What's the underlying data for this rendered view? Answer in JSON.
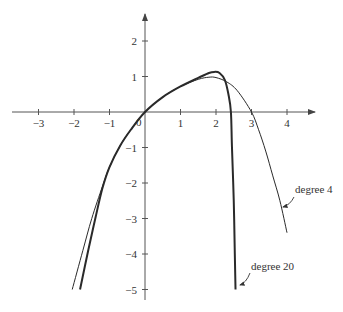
{
  "chart_data": {
    "type": "line",
    "title": "",
    "xlabel": "",
    "ylabel": "",
    "xlim": [
      -3.8,
      4.8
    ],
    "ylim": [
      -5.3,
      2.7
    ],
    "grid": false,
    "legend": "none (inline annotations)",
    "x_ticks": [
      -3,
      -2,
      -1,
      0,
      1,
      2,
      3,
      4
    ],
    "x_tick_labels": [
      "−3",
      "−2",
      "−1",
      "0",
      "1",
      "2",
      "3",
      "4"
    ],
    "y_ticks": [
      2,
      1,
      -1,
      -2,
      -3,
      -4,
      -5
    ],
    "y_tick_labels": [
      "2",
      "1",
      "−1",
      "−2",
      "−3",
      "−4",
      "−5"
    ],
    "series": [
      {
        "name": "degree 4",
        "stroke_width": 1,
        "points": [
          [
            -2.05,
            -5.0
          ],
          [
            -1.75,
            -3.9
          ],
          [
            -1.5,
            -3.0
          ],
          [
            -1.2,
            -2.1
          ],
          [
            -1.0,
            -1.55
          ],
          [
            -0.7,
            -0.95
          ],
          [
            -0.4,
            -0.5
          ],
          [
            0,
            0
          ],
          [
            0.5,
            0.42
          ],
          [
            1.0,
            0.72
          ],
          [
            1.5,
            0.92
          ],
          [
            1.8,
            0.98
          ],
          [
            2.0,
            0.97
          ],
          [
            2.3,
            0.85
          ],
          [
            2.6,
            0.6
          ],
          [
            3.0,
            0.0
          ],
          [
            3.2,
            -0.5
          ],
          [
            3.4,
            -1.1
          ],
          [
            3.6,
            -1.8
          ],
          [
            3.8,
            -2.5
          ],
          [
            4.0,
            -3.4
          ]
        ],
        "annotation": {
          "text": "degree 4",
          "x": 4.3,
          "y": -2.2
        }
      },
      {
        "name": "degree 20",
        "stroke_width": 2,
        "points": [
          [
            -1.83,
            -5.0
          ],
          [
            -1.6,
            -3.9
          ],
          [
            -1.4,
            -3.0
          ],
          [
            -1.2,
            -2.15
          ],
          [
            -1.0,
            -1.55
          ],
          [
            -0.7,
            -0.95
          ],
          [
            -0.4,
            -0.5
          ],
          [
            0,
            0
          ],
          [
            0.5,
            0.42
          ],
          [
            1.0,
            0.72
          ],
          [
            1.5,
            0.96
          ],
          [
            1.8,
            1.1
          ],
          [
            1.95,
            1.13
          ],
          [
            2.1,
            1.1
          ],
          [
            2.25,
            0.9
          ],
          [
            2.35,
            0.5
          ],
          [
            2.42,
            0.0
          ],
          [
            2.45,
            -1.0
          ],
          [
            2.5,
            -2.5
          ],
          [
            2.53,
            -4.0
          ],
          [
            2.55,
            -5.0
          ]
        ],
        "annotation": {
          "text": "degree 20",
          "x": 3.2,
          "y": -4.3
        }
      }
    ]
  },
  "axes": {
    "origin_label": "0"
  }
}
